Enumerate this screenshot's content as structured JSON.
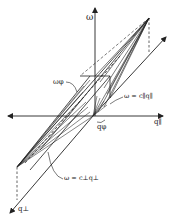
{
  "figure": {
    "labels": {
      "omega_axis": "ω",
      "q_par_axis": "q∥",
      "q_perp_axis": "q⊥",
      "omega_phi": "ωφ",
      "q_phi": "qφ",
      "dispersion_parallel": "ω = c∥q∥",
      "dispersion_perp": "ω = c⊥q⊥"
    },
    "colors": {
      "ink": "#222222",
      "background": "#ffffff"
    }
  }
}
